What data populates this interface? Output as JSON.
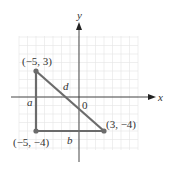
{
  "diagram": {
    "type": "coordinate-plane",
    "axes": {
      "x_label": "x",
      "y_label": "y",
      "origin_label": "0"
    },
    "points": [
      {
        "label": "(−5, 3)",
        "x": -5,
        "y": 3
      },
      {
        "label": "(−5, −4)",
        "x": -5,
        "y": -4
      },
      {
        "label": "(3, −4)",
        "x": 3,
        "y": -4
      }
    ],
    "segments": [
      {
        "label": "a",
        "from": "(−5, 3)",
        "to": "(−5, −4)"
      },
      {
        "label": "b",
        "from": "(−5, −4)",
        "to": "(3, −4)"
      },
      {
        "label": "d",
        "from": "(−5, 3)",
        "to": "(3, −4)"
      }
    ],
    "colors": {
      "triangle": "#6b6b6b",
      "grid": "#e2e2e2",
      "axis": "#333333"
    }
  }
}
